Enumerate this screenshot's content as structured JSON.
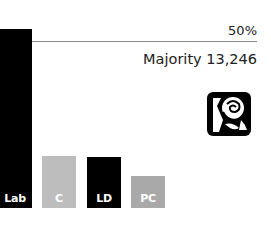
{
  "chart_data": {
    "type": "bar",
    "title": "",
    "categories": [
      "Lab",
      "C",
      "LD",
      "PC"
    ],
    "values": [
      54,
      15.7,
      15.4,
      9.6
    ],
    "colors": [
      "#000000",
      "#bdbdbd",
      "#000000",
      "#a9a9a9"
    ],
    "reference_line": {
      "value": 50,
      "label": "50%"
    },
    "annotation": "Majority 13,246",
    "xlabel": "",
    "ylabel": "",
    "ylim": [
      0,
      55
    ],
    "grid": false,
    "legend": "none"
  },
  "winner": {
    "party": "Lab",
    "icon": "labour-rose-icon"
  },
  "labels": {
    "ref": "50%",
    "majority": "Majority 13,246"
  }
}
